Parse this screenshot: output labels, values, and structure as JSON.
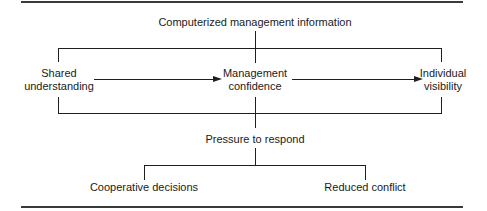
{
  "diagram": {
    "top_node": "Computerized management information",
    "left_node": [
      "Shared",
      "understanding"
    ],
    "center_node": [
      "Management",
      "confidence"
    ],
    "right_node": [
      "Individual",
      "visibility"
    ],
    "middle_node": "Pressure to respond",
    "bottom_left_node": "Cooperative decisions",
    "bottom_right_node": "Reduced conflict",
    "edges": [
      {
        "from": "Shared understanding",
        "to": "Management confidence",
        "type": "arrow"
      },
      {
        "from": "Management confidence",
        "to": "Individual visibility",
        "type": "arrow"
      },
      {
        "from": "Computerized management information",
        "to": "enclosing box",
        "type": "line"
      },
      {
        "from": "enclosing box",
        "to": "Pressure to respond",
        "type": "line"
      },
      {
        "from": "Pressure to respond",
        "to": "Cooperative decisions",
        "type": "branch"
      },
      {
        "from": "Pressure to respond",
        "to": "Reduced conflict",
        "type": "branch"
      }
    ]
  }
}
